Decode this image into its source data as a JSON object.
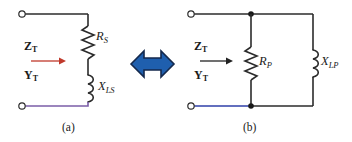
{
  "figure": {
    "panel_a": {
      "caption": "(a)",
      "impedance_label": "Z",
      "impedance_sub": "T",
      "admittance_label": "Y",
      "admittance_sub": "T",
      "arrow_color": "#c0392b",
      "resistor_label": "R",
      "resistor_sub": "S",
      "inductor_label": "X",
      "inductor_sub": "LS",
      "bottom_wire_color": "#7b5ea8"
    },
    "panel_b": {
      "caption": "(b)",
      "impedance_label": "Z",
      "impedance_sub": "T",
      "admittance_label": "Y",
      "admittance_sub": "T",
      "arrow_color": "#222222",
      "resistor_label": "R",
      "resistor_sub": "P",
      "inductor_label": "X",
      "inductor_sub": "LP",
      "bottom_wire_color": "#2f3fa8"
    },
    "equivalence_arrow": {
      "fill_color": "#1f5fae",
      "stroke_color": "#14294d"
    },
    "wire_color": "#2b2b2b",
    "terminal_color": "#2b2b2b"
  }
}
